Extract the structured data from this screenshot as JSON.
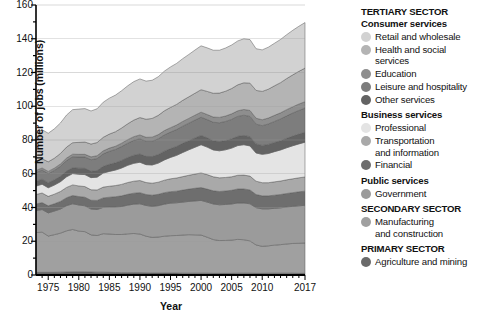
{
  "axes": {
    "ylabel": "Number of jobs (millions)",
    "xlabel": "Year",
    "yticks": [
      "0",
      "20",
      "40",
      "60",
      "80",
      "100",
      "120",
      "140",
      "160"
    ],
    "xticks": [
      "1975",
      "1980",
      "1985",
      "1990",
      "1995",
      "2000",
      "2005",
      "2010",
      "2017"
    ]
  },
  "legend": {
    "groups": [
      {
        "heading": "TERTIARY SECTOR",
        "heading_kind": "sector",
        "subheading": "Consumer services",
        "items": [
          {
            "label": "Retail and wholesale",
            "label2": "",
            "color": "#d2d2d2"
          },
          {
            "label": "Health and social",
            "label2": "services",
            "color": "#b4b4b4"
          },
          {
            "label": "Education",
            "label2": "",
            "color": "#8e8e8e"
          },
          {
            "label": "Leisure and hospitality",
            "label2": "",
            "color": "#7d7d7d"
          },
          {
            "label": "Other services",
            "label2": "",
            "color": "#636363"
          }
        ]
      },
      {
        "heading": "Business services",
        "heading_kind": "sub",
        "subheading": "",
        "items": [
          {
            "label": "Professional",
            "label2": "",
            "color": "#e4e4e4"
          },
          {
            "label": "Transportation",
            "label2": "and information",
            "color": "#a9a9a9"
          },
          {
            "label": "Financial",
            "label2": "",
            "color": "#6e6e6e"
          }
        ]
      },
      {
        "heading": "Public services",
        "heading_kind": "sub",
        "subheading": "",
        "items": [
          {
            "label": "Government",
            "label2": "",
            "color": "#9b9b9b"
          }
        ]
      },
      {
        "heading": "SECONDARY SECTOR",
        "heading_kind": "sector",
        "subheading": "",
        "items": [
          {
            "label": "Manufacturing",
            "label2": "and construction",
            "color": "#a0a0a0"
          }
        ]
      },
      {
        "heading": "PRIMARY SECTOR",
        "heading_kind": "sector",
        "subheading": "",
        "items": [
          {
            "label": "Agriculture and mining",
            "label2": "",
            "color": "#6a6a6a"
          }
        ]
      }
    ]
  },
  "chart_data": {
    "type": "area",
    "stacked": true,
    "title": "",
    "xlabel": "Year",
    "ylabel": "Number of jobs (millions)",
    "xlim": [
      1973,
      2017
    ],
    "ylim": [
      0,
      160
    ],
    "grid": "horizontal",
    "legend_position": "right",
    "x": [
      1973,
      1974,
      1975,
      1976,
      1977,
      1978,
      1979,
      1980,
      1981,
      1982,
      1983,
      1984,
      1985,
      1986,
      1987,
      1988,
      1989,
      1990,
      1991,
      1992,
      1993,
      1994,
      1995,
      1996,
      1997,
      1998,
      1999,
      2000,
      2001,
      2002,
      2003,
      2004,
      2005,
      2006,
      2007,
      2008,
      2009,
      2010,
      2011,
      2012,
      2013,
      2014,
      2015,
      2016,
      2017
    ],
    "series": [
      {
        "name": "Agriculture and mining",
        "sector": "PRIMARY SECTOR",
        "color": "#6a6a6a",
        "values": [
          1.6,
          1.6,
          1.6,
          1.6,
          1.7,
          1.8,
          1.9,
          1.9,
          1.9,
          1.8,
          1.7,
          1.7,
          1.6,
          1.5,
          1.4,
          1.4,
          1.4,
          1.4,
          1.3,
          1.2,
          1.2,
          1.2,
          1.2,
          1.2,
          1.1,
          1.1,
          1.1,
          1.1,
          1.1,
          1.0,
          1.0,
          1.0,
          1.0,
          1.1,
          1.1,
          1.1,
          1.0,
          1.0,
          1.1,
          1.1,
          1.1,
          1.1,
          1.1,
          1.0,
          1.0
        ]
      },
      {
        "name": "Manufacturing and construction",
        "sector": "SECONDARY SECTOR",
        "color": "#a0a0a0",
        "values": [
          23.5,
          23.8,
          21.5,
          22.3,
          23.1,
          24.4,
          25.1,
          24.1,
          23.8,
          22.0,
          21.7,
          22.8,
          22.7,
          22.5,
          22.6,
          23.0,
          23.2,
          22.9,
          21.7,
          21.1,
          21.3,
          21.8,
          22.1,
          22.2,
          22.6,
          22.8,
          22.7,
          22.6,
          21.3,
          20.0,
          19.4,
          19.5,
          19.7,
          20.0,
          19.8,
          19.1,
          16.8,
          16.0,
          16.2,
          16.6,
          16.9,
          17.3,
          17.6,
          17.8,
          18.0
        ]
      },
      {
        "name": "Government",
        "sector": "Public services",
        "color": "#9b9b9b",
        "values": [
          13.0,
          13.4,
          13.7,
          14.0,
          14.3,
          14.9,
          15.2,
          15.5,
          15.3,
          15.3,
          15.4,
          15.6,
          16.0,
          16.3,
          16.6,
          17.0,
          17.4,
          17.9,
          18.2,
          18.4,
          18.6,
          19.0,
          19.3,
          19.4,
          19.5,
          19.7,
          20.1,
          20.5,
          20.8,
          21.1,
          21.2,
          21.3,
          21.4,
          21.6,
          21.8,
          22.0,
          22.1,
          22.2,
          21.9,
          21.8,
          21.8,
          21.9,
          22.0,
          22.2,
          22.3
        ]
      },
      {
        "name": "Financial",
        "sector": "Business services",
        "color": "#6e6e6e",
        "values": [
          4.0,
          4.1,
          4.2,
          4.3,
          4.5,
          4.7,
          4.9,
          5.0,
          5.1,
          5.2,
          5.4,
          5.6,
          5.8,
          6.1,
          6.3,
          6.4,
          6.5,
          6.6,
          6.5,
          6.6,
          6.7,
          6.8,
          6.8,
          6.9,
          7.1,
          7.3,
          7.5,
          7.6,
          7.7,
          7.8,
          7.9,
          8.0,
          8.1,
          8.3,
          8.3,
          8.2,
          7.8,
          7.7,
          7.7,
          7.8,
          7.9,
          8.0,
          8.1,
          8.3,
          8.4
        ]
      },
      {
        "name": "Transportation and information",
        "sector": "Business services",
        "color": "#a9a9a9",
        "values": [
          5.6,
          5.7,
          5.6,
          5.7,
          5.9,
          6.1,
          6.3,
          6.3,
          6.3,
          6.2,
          6.2,
          6.4,
          6.5,
          6.6,
          6.8,
          7.0,
          7.1,
          7.2,
          7.1,
          7.1,
          7.2,
          7.4,
          7.6,
          7.8,
          8.0,
          8.2,
          8.4,
          8.7,
          8.6,
          8.3,
          8.1,
          8.0,
          8.0,
          8.1,
          8.2,
          8.2,
          7.9,
          7.8,
          7.8,
          7.9,
          8.0,
          8.1,
          8.2,
          8.3,
          8.4
        ]
      },
      {
        "name": "Professional",
        "sector": "Business services",
        "color": "#e4e4e4",
        "values": [
          5.0,
          5.2,
          5.1,
          5.4,
          5.8,
          6.3,
          6.7,
          6.9,
          7.1,
          7.2,
          7.6,
          8.3,
          8.8,
          9.2,
          9.7,
          10.2,
          10.6,
          10.8,
          10.6,
          10.8,
          11.3,
          12.0,
          12.7,
          13.4,
          14.3,
          15.1,
          15.9,
          16.7,
          16.3,
          15.9,
          16.0,
          16.4,
          17.0,
          17.6,
          18.0,
          17.9,
          16.7,
          16.8,
          17.3,
          17.9,
          18.4,
          19.0,
          19.6,
          20.1,
          20.6
        ]
      },
      {
        "name": "Other services",
        "sector": "Consumer services",
        "color": "#636363",
        "values": [
          2.9,
          3.0,
          3.0,
          3.1,
          3.2,
          3.4,
          3.5,
          3.6,
          3.7,
          3.8,
          3.9,
          4.0,
          4.2,
          4.3,
          4.5,
          4.6,
          4.8,
          4.9,
          4.9,
          5.0,
          5.1,
          5.2,
          5.2,
          5.3,
          5.4,
          5.4,
          5.5,
          5.5,
          5.5,
          5.5,
          5.5,
          5.5,
          5.5,
          5.5,
          5.5,
          5.5,
          5.4,
          5.3,
          5.4,
          5.4,
          5.5,
          5.6,
          5.7,
          5.8,
          5.9
        ]
      },
      {
        "name": "Leisure and hospitality",
        "sector": "Consumer services",
        "color": "#7d7d7d",
        "values": [
          5.2,
          5.4,
          5.4,
          5.6,
          5.9,
          6.2,
          6.5,
          6.6,
          6.7,
          6.8,
          7.1,
          7.4,
          7.7,
          7.9,
          8.2,
          8.5,
          8.8,
          9.0,
          9.0,
          9.1,
          9.3,
          9.6,
          9.8,
          10.0,
          10.2,
          10.4,
          10.6,
          10.8,
          10.8,
          10.9,
          11.1,
          11.3,
          11.5,
          11.8,
          12.0,
          12.0,
          11.7,
          11.7,
          12.1,
          12.5,
          12.9,
          13.3,
          13.7,
          14.0,
          14.3
        ]
      },
      {
        "name": "Education",
        "sector": "Consumer services",
        "color": "#8e8e8e",
        "values": [
          1.2,
          1.2,
          1.3,
          1.3,
          1.4,
          1.5,
          1.5,
          1.6,
          1.6,
          1.7,
          1.7,
          1.8,
          1.9,
          1.9,
          2.0,
          2.1,
          2.2,
          2.3,
          2.3,
          2.4,
          2.5,
          2.6,
          2.6,
          2.7,
          2.8,
          2.8,
          2.9,
          3.0,
          3.0,
          3.1,
          3.2,
          3.2,
          3.3,
          3.3,
          3.4,
          3.5,
          3.5,
          3.5,
          3.5,
          3.6,
          3.6,
          3.7,
          3.7,
          3.8,
          3.8
        ]
      },
      {
        "name": "Health and social services",
        "sector": "Consumer services",
        "color": "#b4b4b4",
        "values": [
          5.3,
          5.5,
          5.7,
          5.9,
          6.2,
          6.5,
          6.8,
          7.1,
          7.3,
          7.6,
          7.8,
          8.0,
          8.3,
          8.6,
          9.0,
          9.4,
          9.8,
          10.3,
          10.7,
          11.1,
          11.4,
          11.7,
          12.0,
          12.2,
          12.5,
          12.8,
          13.0,
          13.3,
          13.7,
          14.1,
          14.4,
          14.7,
          15.0,
          15.4,
          15.8,
          16.2,
          16.5,
          16.8,
          17.1,
          17.5,
          17.9,
          18.4,
          18.9,
          19.4,
          19.9
        ]
      },
      {
        "name": "Retail and wholesale",
        "sector": "Consumer services",
        "color": "#d2d2d2",
        "values": [
          16.9,
          17.2,
          16.9,
          17.4,
          18.1,
          19.0,
          19.6,
          19.7,
          19.8,
          19.6,
          20.0,
          20.8,
          21.3,
          21.7,
          22.1,
          22.5,
          22.8,
          22.9,
          22.6,
          22.6,
          22.9,
          23.5,
          24.0,
          24.3,
          24.7,
          25.1,
          25.6,
          26.0,
          25.8,
          25.5,
          25.4,
          25.6,
          25.8,
          26.0,
          26.1,
          25.8,
          24.7,
          24.6,
          24.9,
          25.2,
          25.6,
          26.0,
          26.4,
          26.7,
          27.0
        ]
      }
    ],
    "totals_note": "Stacked totals rise from about 84 million jobs in 1973 to about 150 million in 2017"
  }
}
